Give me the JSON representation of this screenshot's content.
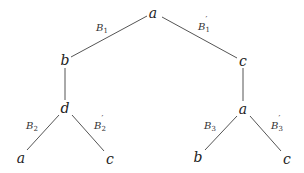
{
  "diagram": {
    "type": "tree",
    "nodes": [
      {
        "id": "root",
        "label": "a",
        "x": 153,
        "y": 13
      },
      {
        "id": "n_b",
        "label": "b",
        "x": 65,
        "y": 60
      },
      {
        "id": "n_c",
        "label": "c",
        "x": 243,
        "y": 61
      },
      {
        "id": "n_d",
        "label": "d",
        "x": 65,
        "y": 108
      },
      {
        "id": "n_a2",
        "label": "a",
        "x": 243,
        "y": 109
      },
      {
        "id": "leaf_a",
        "label": "a",
        "x": 21,
        "y": 158
      },
      {
        "id": "leaf_c1",
        "label": "c",
        "x": 110,
        "y": 159
      },
      {
        "id": "leaf_b",
        "label": "b",
        "x": 198,
        "y": 157
      },
      {
        "id": "leaf_c2",
        "label": "c",
        "x": 287,
        "y": 159
      }
    ],
    "edges": [
      {
        "from": "root",
        "to": "n_b",
        "label": {
          "base": "B",
          "sub": "1",
          "prime": ""
        },
        "x1": 147,
        "y1": 16,
        "x2": 71,
        "y2": 57,
        "lx": 102,
        "ly": 29
      },
      {
        "from": "root",
        "to": "n_c",
        "label": {
          "base": "B",
          "sub": "1",
          "prime": "′"
        },
        "x1": 162,
        "y1": 17,
        "x2": 237,
        "y2": 58,
        "lx": 204,
        "ly": 28
      },
      {
        "from": "n_b",
        "to": "n_d",
        "label": null,
        "x1": 65,
        "y1": 68,
        "x2": 65,
        "y2": 100
      },
      {
        "from": "n_c",
        "to": "n_a2",
        "label": null,
        "x1": 243,
        "y1": 68,
        "x2": 243,
        "y2": 101
      },
      {
        "from": "n_d",
        "to": "leaf_a",
        "label": {
          "base": "B",
          "sub": "2",
          "prime": ""
        },
        "x1": 59,
        "y1": 115,
        "x2": 27,
        "y2": 150,
        "lx": 32,
        "ly": 127
      },
      {
        "from": "n_d",
        "to": "leaf_c1",
        "label": {
          "base": "B",
          "sub": "2",
          "prime": "′"
        },
        "x1": 72,
        "y1": 115,
        "x2": 104,
        "y2": 151,
        "lx": 100,
        "ly": 127
      },
      {
        "from": "n_a2",
        "to": "leaf_b",
        "label": {
          "base": "B",
          "sub": "3",
          "prime": ""
        },
        "x1": 237,
        "y1": 116,
        "x2": 205,
        "y2": 150,
        "lx": 210,
        "ly": 127
      },
      {
        "from": "n_a2",
        "to": "leaf_c2",
        "label": {
          "base": "B",
          "sub": "3",
          "prime": "′"
        },
        "x1": 250,
        "y1": 116,
        "x2": 281,
        "y2": 151,
        "lx": 277,
        "ly": 127
      }
    ]
  },
  "nodes": {
    "root": "a",
    "b": "b",
    "c": "c",
    "d": "d",
    "a2": "a",
    "leaf_a": "a",
    "leaf_c1": "c",
    "leaf_b": "b",
    "leaf_c2": "c"
  },
  "edge_labels": {
    "e1": {
      "base": "B",
      "sub": "1",
      "prime": ""
    },
    "e2": {
      "base": "B",
      "sub": "1",
      "prime": "′"
    },
    "e3": {
      "base": "B",
      "sub": "2",
      "prime": ""
    },
    "e4": {
      "base": "B",
      "sub": "2",
      "prime": "′"
    },
    "e5": {
      "base": "B",
      "sub": "3",
      "prime": ""
    },
    "e6": {
      "base": "B",
      "sub": "3",
      "prime": "′"
    }
  },
  "colors": {
    "background": "#ffffff",
    "line": "#555555",
    "text": "#222222"
  }
}
